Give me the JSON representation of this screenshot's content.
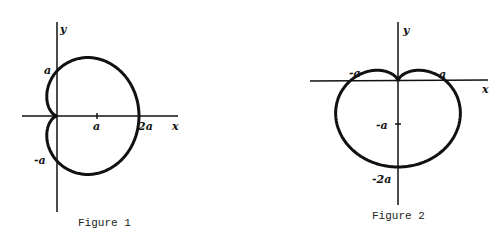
{
  "figures": [
    {
      "caption": "Figure 1",
      "x_axis_label": "x",
      "y_axis_label": "y",
      "labels": {
        "a_y": "a",
        "neg_a_y": "-a",
        "a_x": "a",
        "two_a_x": "2a"
      },
      "curve": "cardioid r = a(1 + cos θ)"
    },
    {
      "caption": "Figure 2",
      "x_axis_label": "x",
      "y_axis_label": "y",
      "labels": {
        "neg_a_x": "-a",
        "a_x": "a",
        "neg_a_y": "-a",
        "neg_two_a_y": "-2a"
      },
      "curve": "cardioid r = a(1 - sin θ)"
    }
  ]
}
